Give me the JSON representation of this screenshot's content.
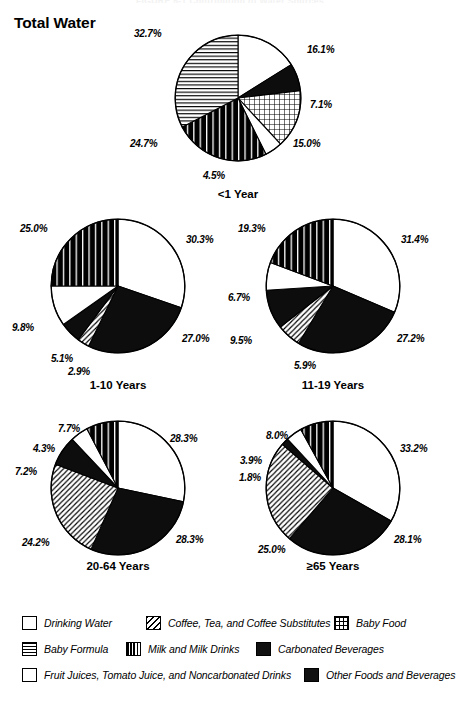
{
  "page": {
    "cut_header": "FIGURE 5-1 Contribution of Water Sources",
    "main_title": "Total Water"
  },
  "legend": {
    "items": [
      {
        "key": "drinking-water",
        "label": "Drinking Water",
        "pattern": "white"
      },
      {
        "key": "coffee-tea",
        "label": "Coffee, Tea, and Coffee Substitutes",
        "pattern": "diagonal"
      },
      {
        "key": "baby-food",
        "label": "Baby Food",
        "pattern": "grid"
      },
      {
        "key": "baby-formula",
        "label": "Baby Formula",
        "pattern": "hlines"
      },
      {
        "key": "milk",
        "label": "Milk and Milk Drinks",
        "pattern": "vlines"
      },
      {
        "key": "carbonated",
        "label": "Carbonated Beverages",
        "pattern": "solid"
      },
      {
        "key": "fruit-juices",
        "label": "Fruit Juices, Tomato Juice, and Noncarbonated Drinks",
        "pattern": "white"
      },
      {
        "key": "other-foods",
        "label": "Other Foods and Beverages",
        "pattern": "solid"
      }
    ]
  },
  "chart_data": [
    {
      "type": "pie",
      "title": "<1 Year",
      "labels": [
        "Drinking Water",
        "Carbonated Beverages",
        "Baby Food",
        "Fruit Juices, Tomato Juice, and Noncarbonated Drinks",
        "Milk and Milk Drinks",
        "Baby Formula"
      ],
      "patterns": [
        "white",
        "solid",
        "grid",
        "white",
        "vlines",
        "hlines"
      ],
      "values": [
        16.1,
        7.1,
        15.0,
        4.5,
        24.7,
        32.7
      ],
      "value_labels": [
        "16.1%",
        "7.1%",
        "15.0%",
        "4.5%",
        "24.7%",
        "32.7%"
      ]
    },
    {
      "type": "pie",
      "title": "1-10 Years",
      "labels": [
        "Drinking Water",
        "Other Foods and Beverages",
        "Coffee, Tea, and Coffee Substitutes",
        "Carbonated Beverages",
        "Fruit Juices, Tomato Juice, and Noncarbonated Drinks",
        "Milk and Milk Drinks"
      ],
      "patterns": [
        "white",
        "solid",
        "diagonal",
        "solid",
        "white",
        "vlines"
      ],
      "values": [
        30.3,
        27.0,
        2.9,
        5.1,
        9.8,
        25.0
      ],
      "value_labels": [
        "30.3%",
        "27.0%",
        "2.9%",
        "5.1%",
        "9.8%",
        "25.0%"
      ]
    },
    {
      "type": "pie",
      "title": "11-19 Years",
      "labels": [
        "Drinking Water",
        "Other Foods and Beverages",
        "Coffee, Tea, and Coffee Substitutes",
        "Carbonated Beverages",
        "Fruit Juices, Tomato Juice, and Noncarbonated Drinks",
        "Milk and Milk Drinks"
      ],
      "patterns": [
        "white",
        "solid",
        "diagonal",
        "solid",
        "white",
        "vlines"
      ],
      "values": [
        31.4,
        27.2,
        5.9,
        9.5,
        6.7,
        19.3
      ],
      "value_labels": [
        "31.4%",
        "27.2%",
        "5.9%",
        "9.5%",
        "6.7%",
        "19.3%"
      ]
    },
    {
      "type": "pie",
      "title": "20-64 Years",
      "labels": [
        "Drinking Water",
        "Other Foods and Beverages",
        "Coffee, Tea, and Coffee Substitutes",
        "Carbonated Beverages",
        "Fruit Juices, Tomato Juice, and Noncarbonated Drinks",
        "Milk and Milk Drinks"
      ],
      "patterns": [
        "white",
        "solid",
        "diagonal",
        "solid",
        "white",
        "vlines"
      ],
      "values": [
        28.3,
        28.3,
        24.2,
        7.2,
        4.3,
        7.7
      ],
      "value_labels": [
        "28.3%",
        "28.3%",
        "24.2%",
        "7.2%",
        "4.3%",
        "7.7%"
      ]
    },
    {
      "type": "pie",
      "title": "≥65 Years",
      "labels": [
        "Drinking Water",
        "Other Foods and Beverages",
        "Coffee, Tea, and Coffee Substitutes",
        "Carbonated Beverages",
        "Fruit Juices, Tomato Juice, and Noncarbonated Drinks",
        "Milk and Milk Drinks"
      ],
      "patterns": [
        "white",
        "solid",
        "diagonal",
        "solid",
        "white",
        "vlines"
      ],
      "values": [
        33.2,
        28.1,
        25.0,
        1.8,
        3.9,
        8.0
      ],
      "value_labels": [
        "33.2%",
        "28.1%",
        "25.0%",
        "1.8%",
        "3.9%",
        "8.0%"
      ]
    }
  ]
}
